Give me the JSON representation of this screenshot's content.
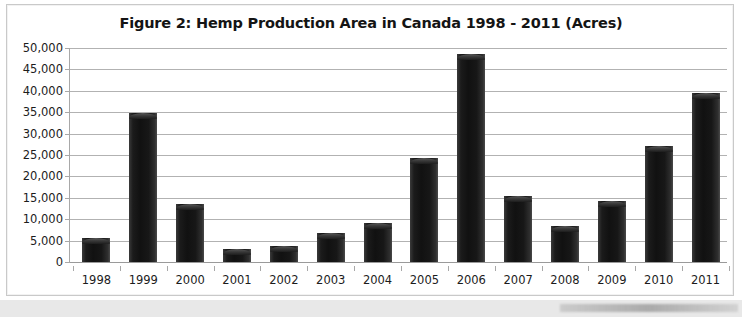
{
  "figure": {
    "title": "Figure 2:  Hemp Production Area in Canada 1998 - 2011 (Acres)"
  },
  "colors": {
    "bar": "#161616",
    "gridline": "#b2b2b2",
    "axis": "#a8a8a8",
    "frame": "#c9c9c9",
    "text": "#1c1c1c",
    "background": "#ffffff"
  },
  "chart_data": {
    "type": "bar",
    "title": "Figure 2:  Hemp Production Area in Canada 1998 - 2011 (Acres)",
    "xlabel": "",
    "ylabel": "",
    "categories": [
      "1998",
      "1999",
      "2000",
      "2001",
      "2002",
      "2003",
      "2004",
      "2005",
      "2006",
      "2007",
      "2008",
      "2009",
      "2010",
      "2011"
    ],
    "values": [
      5600,
      34800,
      13500,
      3000,
      3800,
      6700,
      9000,
      24300,
      48500,
      15400,
      8400,
      14200,
      27200,
      39400
    ],
    "ylim": [
      0,
      50000
    ],
    "ytick_step": 5000,
    "ytick_labels": [
      "50,000",
      "45,000",
      "40,000",
      "35,000",
      "30,000",
      "25,000",
      "20,000",
      "15,000",
      "10,000",
      "5,000",
      "0"
    ],
    "ytick_values": [
      50000,
      45000,
      40000,
      35000,
      30000,
      25000,
      20000,
      15000,
      10000,
      5000,
      0
    ],
    "grid": true,
    "legend": false,
    "legend_position": "none",
    "units": "Acres"
  }
}
